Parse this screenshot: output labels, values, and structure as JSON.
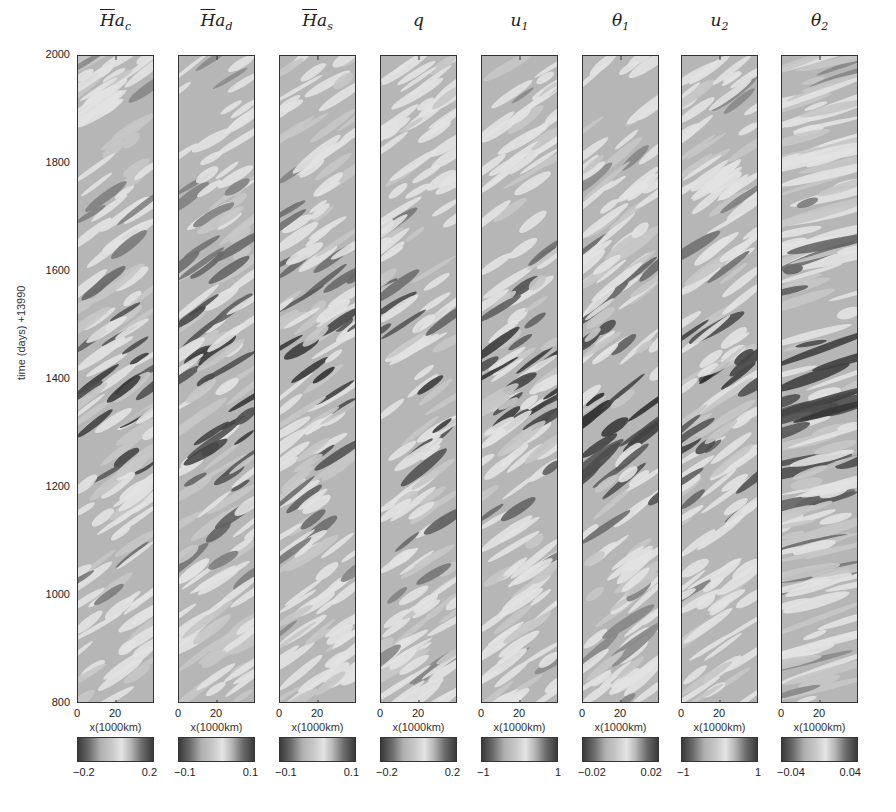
{
  "chart_data": {
    "type": "heatmap",
    "ylabel": "time (days) +13990",
    "xlabel": "x(1000km)",
    "ylim": [
      800,
      2000
    ],
    "yticks": [
      800,
      1000,
      1200,
      1400,
      1600,
      1800,
      2000
    ],
    "xlim": [
      0,
      40
    ],
    "xticks": [
      0,
      20
    ],
    "colormap": "grayscale: dark (low) - light (mid) - dark (high)",
    "panels": [
      {
        "name": "Ha_c",
        "title_bar": "H",
        "title_var": "a",
        "title_sub": "c",
        "clim": [
          -0.2,
          0.2
        ],
        "clabels": [
          "-0.2",
          "0.2"
        ],
        "intensity_peak_day": 1360,
        "tilt": 0.35,
        "bands": 0.55
      },
      {
        "name": "Ha_d",
        "title_bar": "H",
        "title_var": "a",
        "title_sub": "d",
        "clim": [
          -0.1,
          0.1
        ],
        "clabels": [
          "-0.1",
          "0.1"
        ],
        "intensity_peak_day": 1380,
        "tilt": 0.35,
        "bands": 0.6
      },
      {
        "name": "Ha_s",
        "title_bar": "H",
        "title_var": "a",
        "title_sub": "s",
        "clim": [
          -0.1,
          0.1
        ],
        "clabels": [
          "-0.1",
          "0.1"
        ],
        "intensity_peak_day": 1400,
        "tilt": 0.35,
        "bands": 0.6
      },
      {
        "name": "q",
        "title_bar": "",
        "title_var": "q",
        "title_sub": "",
        "clim": [
          -0.2,
          0.2
        ],
        "clabels": [
          "-0.2",
          "0.2"
        ],
        "intensity_peak_day": 1380,
        "tilt": 0.35,
        "bands": 0.6
      },
      {
        "name": "u_1",
        "title_bar": "",
        "title_var": "u",
        "title_sub": "1",
        "clim": [
          -1,
          1
        ],
        "clabels": [
          "-1",
          "1"
        ],
        "intensity_peak_day": 1390,
        "tilt": 0.35,
        "bands": 0.55
      },
      {
        "name": "theta_1",
        "title_bar": "",
        "title_var": "θ",
        "title_sub": "1",
        "clim": [
          -0.02,
          0.02
        ],
        "clabels": [
          "-0.02",
          "0.02"
        ],
        "intensity_peak_day": 1350,
        "tilt": 0.4,
        "bands": 0.65
      },
      {
        "name": "u_2",
        "title_bar": "",
        "title_var": "u",
        "title_sub": "2",
        "clim": [
          -1,
          1
        ],
        "clabels": [
          "-1",
          "1"
        ],
        "intensity_peak_day": 1390,
        "tilt": 0.35,
        "bands": 0.45
      },
      {
        "name": "theta_2",
        "title_bar": "",
        "title_var": "θ",
        "title_sub": "2",
        "clim": [
          -0.04,
          0.04
        ],
        "clabels": [
          "-0.04",
          "0.04"
        ],
        "intensity_peak_day": 1390,
        "tilt": 0.12,
        "bands": 0.8
      }
    ]
  },
  "labels": {
    "ylabel": "time (days) +13990",
    "xlabel": "x(1000km)",
    "yticks": [
      "2000",
      "1800",
      "1600",
      "1400",
      "1200",
      "1000",
      "800"
    ],
    "xtick0": "0",
    "xtick20": "20"
  }
}
